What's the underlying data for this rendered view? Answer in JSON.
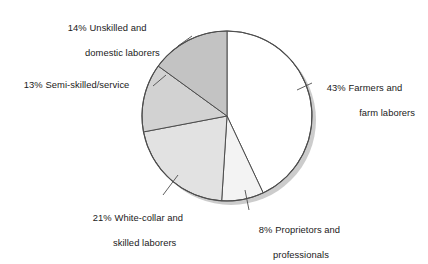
{
  "chart_data": {
    "type": "pie",
    "title": "",
    "subtitle": "",
    "xlabel": "",
    "ylabel": "",
    "legend_position": "callout-labels",
    "grid": false,
    "total": 100,
    "units": "percent",
    "categories": [
      "Farmers and farm laborers",
      "Proprietors and professionals",
      "White-collar and skilled laborers",
      "Semi-skilled/service",
      "Unskilled and domestic laborers"
    ],
    "values": [
      43,
      8,
      21,
      13,
      14
    ],
    "slices": [
      {
        "id": "farmers",
        "percent_label": "43%",
        "value": 43,
        "name_line1": "Farmers and",
        "name_line2": "farm laborers",
        "color": "#ffffff",
        "start_angle": 0,
        "end_angle": 154.8
      },
      {
        "id": "proprietors",
        "percent_label": "8%",
        "value": 8,
        "name_line1": "Proprietors and",
        "name_line2": "professionals",
        "color": "#f3f3f3",
        "start_angle": 154.8,
        "end_angle": 183.6
      },
      {
        "id": "white-collar",
        "percent_label": "21%",
        "value": 21,
        "name_line1": "White-collar and",
        "name_line2": "skilled laborers",
        "color": "#e2e2e2",
        "start_angle": 183.6,
        "end_angle": 259.2
      },
      {
        "id": "semi-skilled",
        "percent_label": "13%",
        "value": 13,
        "name_line1": "Semi-skilled/service",
        "name_line2": "",
        "color": "#d2d2d2",
        "start_angle": 259.2,
        "end_angle": 306.0
      },
      {
        "id": "unskilled",
        "percent_label": "14%",
        "value": 14,
        "name_line1": "Unskilled and",
        "name_line2": "domestic laborers",
        "color": "#c3c3c3",
        "start_angle": 306.0,
        "end_angle": 360.0
      }
    ],
    "style": {
      "outline_color": "#4d4d4d",
      "shadow_color": "#cccccc",
      "leader_color": "#4d4d4d",
      "center_x": 227,
      "center_y": 116,
      "radius": 85
    }
  }
}
